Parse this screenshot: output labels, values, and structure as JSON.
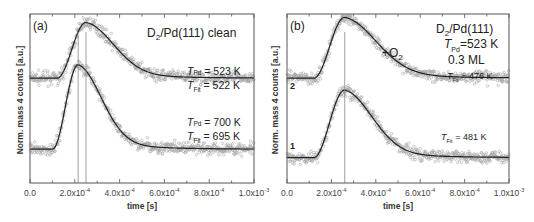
{
  "chart_data": [
    {
      "panel": "(a)",
      "type": "scatter",
      "title": "D2/Pd(111) clean",
      "title_parts": {
        "pre": "D",
        "sub": "2",
        "post": "/Pd(111) clean"
      },
      "xlabel": "time [s]",
      "ylabel": "Norm. mass 4 counts [a.u.]",
      "xlim": [
        0,
        0.001
      ],
      "xticks": [
        "0.0",
        "2.0x10-4",
        "4.0x10-4",
        "6.0x10-4",
        "8.0x10-4",
        "1.0x10-3"
      ],
      "xtick_parts": [
        {
          "m": "0.0",
          "e": ""
        },
        {
          "m": "2.0x10",
          "e": "-4"
        },
        {
          "m": "4.0x10",
          "e": "-4"
        },
        {
          "m": "6.0x10",
          "e": "-4"
        },
        {
          "m": "8.0x10",
          "e": "-4"
        },
        {
          "m": "1.0x10",
          "e": "-3"
        }
      ],
      "series": [
        {
          "name": "T_Pd = 523 K, T_Fit = 522 K",
          "baseline": 0.62,
          "peak_time": 0.00025,
          "onset": 0.00012,
          "peak_height": 0.33,
          "decay": 0.00013
        },
        {
          "name": "T_Pd = 700 K, T_Fit = 695 K",
          "baseline": 0.2,
          "peak_time": 0.000215,
          "onset": 0.0001,
          "peak_height": 0.5,
          "decay": 0.00011
        }
      ],
      "vlines": [
        0.000215,
        0.00025
      ],
      "annotations": [
        {
          "label": "T",
          "sub": "Pd",
          "text": " = 523 K"
        },
        {
          "label": "T",
          "sub": "Fit",
          "text": " = 522 K"
        },
        {
          "label": "T",
          "sub": "Pd",
          "text": " = 700 K"
        },
        {
          "label": "T",
          "sub": "Fit",
          "text": " = 695 K"
        }
      ],
      "legend": "none",
      "grid": false
    },
    {
      "panel": "(b)",
      "type": "scatter",
      "title": "D2/Pd(111)",
      "title_parts": {
        "pre": "D",
        "sub": "2",
        "post": "/Pd(111)"
      },
      "xlabel": "time [s]",
      "ylabel": "Norm. mass 4 counts [a.u.]",
      "xlim": [
        0,
        0.001
      ],
      "xticks": [
        "0.0",
        "2.0x10-4",
        "4.0x10-4",
        "6.0x10-4",
        "8.0x10-4",
        "1.0x10-3"
      ],
      "xtick_parts": [
        {
          "m": "0.0",
          "e": ""
        },
        {
          "m": "2.0x10",
          "e": "-4"
        },
        {
          "m": "4.0x10",
          "e": "-4"
        },
        {
          "m": "6.0x10",
          "e": "-4"
        },
        {
          "m": "8.0x10",
          "e": "-4"
        },
        {
          "m": "1.0x10",
          "e": "-3"
        }
      ],
      "series": [
        {
          "name": "2 (+O2, T_Fit = 476 K)",
          "curve_label": "2",
          "baseline": 0.62,
          "peak_time": 0.00026,
          "onset": 0.00012,
          "peak_height": 0.36,
          "decay": 0.00015
        },
        {
          "name": "1 (T_Fit = 481 K)",
          "curve_label": "1",
          "baseline": 0.15,
          "peak_time": 0.00026,
          "onset": 0.00012,
          "peak_height": 0.4,
          "decay": 0.00013
        }
      ],
      "vlines": [
        0.00026
      ],
      "annotations": [
        {
          "label": "T",
          "sub": "Pd",
          "text": "=523 K"
        },
        {
          "label": "",
          "sub": "",
          "text": "0.3 ML"
        },
        {
          "label": "+O",
          "sub": "2",
          "text": ""
        },
        {
          "label": "T",
          "sub": "Fit",
          "text": " = 476 K"
        },
        {
          "label": "T",
          "sub": "Fit",
          "text": " = 481 K"
        }
      ],
      "legend": "none",
      "grid": false
    }
  ]
}
